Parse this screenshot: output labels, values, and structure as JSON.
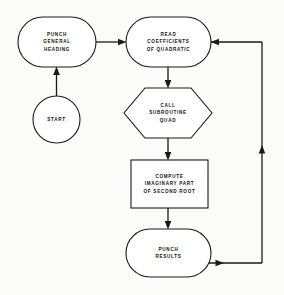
{
  "diagram": {
    "type": "flowchart",
    "background_color": "#fbfbfa",
    "line_color": "#1a1a1a",
    "fill_color": "#ffffff",
    "nodes": [
      {
        "id": "punch-general-heading",
        "shape": "stadium",
        "lines": [
          "PUNCH",
          "GENERAL",
          "HEADING"
        ],
        "x": 18,
        "y": 17,
        "w": 78,
        "h": 50
      },
      {
        "id": "start",
        "shape": "circle",
        "lines": [
          "START"
        ],
        "x": 33,
        "y": 96,
        "w": 47,
        "h": 47
      },
      {
        "id": "read-coefficients-of-quadratic",
        "shape": "stadium",
        "lines": [
          "READ",
          "COEFFICIENTS",
          "OF QUADRATIC"
        ],
        "x": 126,
        "y": 17,
        "w": 85,
        "h": 50
      },
      {
        "id": "call-subroutine-quad",
        "shape": "hexagon",
        "lines": [
          "CALL",
          "SUBROUTINE",
          "QUAD"
        ],
        "x": 124,
        "y": 88,
        "w": 88,
        "h": 50
      },
      {
        "id": "compute-imaginary-part-of-second-root",
        "shape": "rectangle",
        "lines": [
          "COMPUTE",
          "IMAGINARY PART",
          "OF SECOND ROOT"
        ],
        "x": 131,
        "y": 160,
        "w": 77,
        "h": 48
      },
      {
        "id": "punch-results",
        "shape": "stadium",
        "lines": [
          "PUNCH",
          "RESULTS"
        ],
        "x": 126,
        "y": 229,
        "w": 85,
        "h": 48
      }
    ],
    "connectors": [
      {
        "id": "start-to-punch-general-heading",
        "from": "start",
        "to": "punch-general-heading",
        "direction": "up"
      },
      {
        "id": "punch-general-heading-to-read",
        "from": "punch-general-heading",
        "to": "read-coefficients-of-quadratic",
        "direction": "right"
      },
      {
        "id": "read-to-call-subroutine",
        "from": "read-coefficients-of-quadratic",
        "to": "call-subroutine-quad",
        "direction": "down"
      },
      {
        "id": "call-subroutine-to-compute",
        "from": "call-subroutine-quad",
        "to": "compute-imaginary-part-of-second-root",
        "direction": "down"
      },
      {
        "id": "compute-to-punch-results",
        "from": "compute-imaginary-part-of-second-root",
        "to": "punch-results",
        "direction": "down"
      },
      {
        "id": "punch-results-loop-back-to-read",
        "from": "punch-results",
        "to": "read-coefficients-of-quadratic",
        "direction": "loop-right-up-left"
      }
    ]
  }
}
